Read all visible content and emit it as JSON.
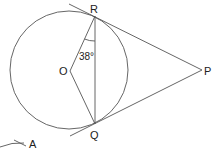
{
  "diagram": {
    "type": "geometry",
    "points": {
      "R": {
        "label": "R",
        "x": 95,
        "y": 16
      },
      "Q": {
        "label": "Q",
        "x": 95,
        "y": 124
      },
      "O": {
        "label": "O",
        "x": 70,
        "y": 71
      },
      "P": {
        "label": "P",
        "x": 202,
        "y": 70
      },
      "A": {
        "label": "A"
      }
    },
    "circle": {
      "cx": 69,
      "cy": 70,
      "r": 59
    },
    "angle": {
      "label": "38°",
      "at": "R",
      "between": [
        "O",
        "Q"
      ]
    },
    "segments": [
      "OR",
      "OQ",
      "RQ",
      "RP",
      "QP"
    ]
  }
}
